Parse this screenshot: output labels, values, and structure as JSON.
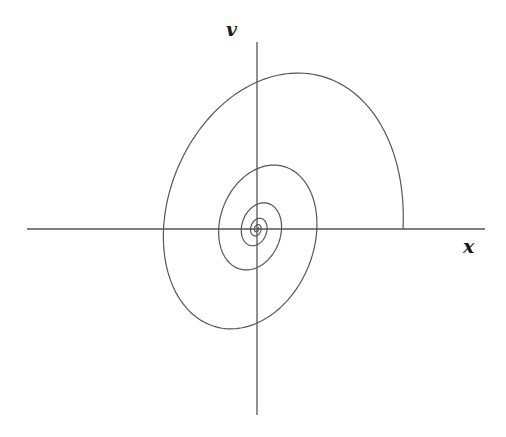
{
  "diagram": {
    "type": "phase-portrait-spiral",
    "axes": {
      "horizontal": {
        "label": "x",
        "x1": 27,
        "x2": 485,
        "y": 229
      },
      "vertical": {
        "label": "v",
        "x": 257,
        "y1": 42,
        "y2": 415
      }
    },
    "spiral": {
      "center": [
        257,
        229
      ],
      "start_point": [
        403,
        229
      ],
      "direction": "counterclockwise",
      "radius_x": 146,
      "radius_y": 193,
      "skew": 30,
      "decay_per_radian": 0.142,
      "turns": 5.2,
      "samples": 900
    },
    "colors": {
      "axis": "#555555",
      "curve": "#555555",
      "background": "#ffffff"
    }
  }
}
